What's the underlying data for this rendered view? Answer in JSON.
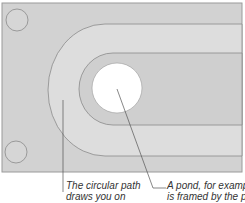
{
  "diagram": {
    "colors": {
      "background": "#ffffff",
      "ground": "#d2d2d2",
      "path": "#dcdcdc",
      "inner_ground": "#cfcfcf",
      "pond": "#ffffff",
      "stroke": "#8a8a8a",
      "leader": "#555555"
    },
    "elements": [
      {
        "name": "ground-frame"
      },
      {
        "name": "circular-path"
      },
      {
        "name": "pond"
      },
      {
        "name": "corner-feature-top-left"
      },
      {
        "name": "corner-feature-bottom-left"
      }
    ]
  },
  "captions": {
    "left": {
      "line1": "The circular path",
      "line2": "draws you on"
    },
    "right": {
      "line1": "A pond, for example,",
      "line2": "is framed by the path"
    }
  }
}
